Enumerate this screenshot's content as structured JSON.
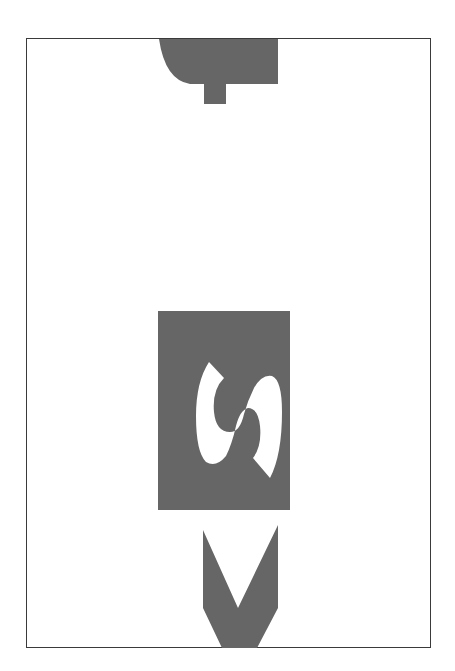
{
  "figure": {
    "glyph_letter": "S",
    "colors": {
      "fill": "#666666",
      "background": "#ffffff",
      "border": "#3a3a3a"
    }
  }
}
